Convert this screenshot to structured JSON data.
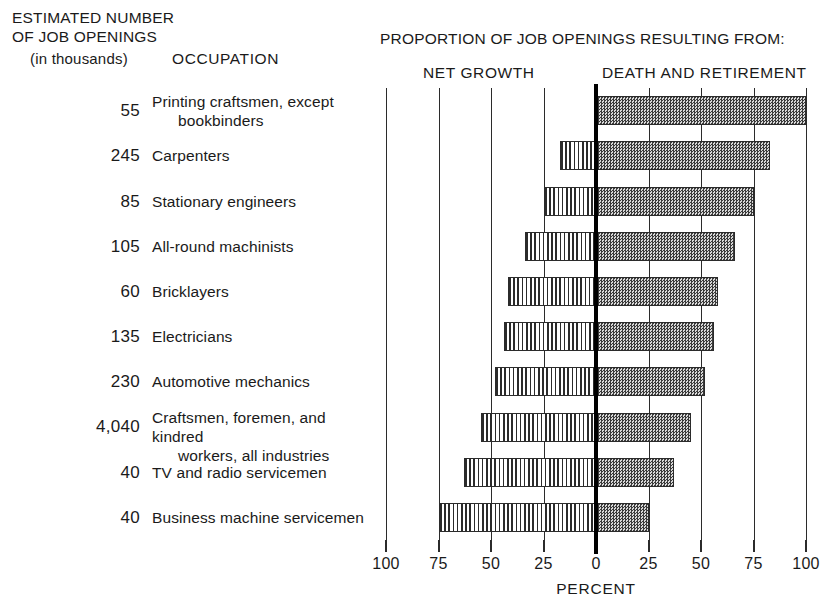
{
  "headers": {
    "left_line1": "ESTIMATED NUMBER",
    "left_line2": "OF JOB OPENINGS",
    "left_line3": "(in thousands)",
    "occupation": "OCCUPATION",
    "proportion_title": "PROPORTION OF JOB OPENINGS RESULTING FROM:",
    "net_growth": "NET GROWTH",
    "death_and_retirement": "DEATH AND RETIREMENT"
  },
  "axis": {
    "title": "PERCENT",
    "tick_labels": [
      "100",
      "75",
      "50",
      "25",
      "0",
      "25",
      "50",
      "75",
      "100"
    ],
    "tick_values": [
      -100,
      -75,
      -50,
      -25,
      0,
      25,
      50,
      75,
      100
    ]
  },
  "colors": {
    "ink": "#2b2b2b",
    "zero_line": "#000000",
    "death_fill": "#8d8d8d",
    "growth_fill": "#ffffff"
  },
  "chart_data": {
    "type": "bar",
    "title": "PROPORTION OF JOB OPENINGS RESULTING FROM:",
    "xlabel": "PERCENT",
    "ylabel": "OCCUPATION",
    "xlim": [
      -100,
      100
    ],
    "grid": true,
    "legend_position": "top",
    "orientation": "horizontal-diverging",
    "categories": [
      "Printing craftsmen, except bookbinders",
      "Carpenters",
      "Stationary engineers",
      "All-round machinists",
      "Bricklayers",
      "Electricians",
      "Automotive mechanics",
      "Craftsmen, foremen, and kindred workers, all industries",
      "TV and radio servicemen",
      "Business machine servicemen"
    ],
    "series": [
      {
        "name": "NET GROWTH",
        "values": [
          0,
          17,
          25,
          34,
          42,
          44,
          48,
          55,
          63,
          75
        ]
      },
      {
        "name": "DEATH AND RETIREMENT",
        "values": [
          100,
          83,
          75,
          66,
          58,
          56,
          52,
          45,
          37,
          25
        ]
      }
    ],
    "estimated_job_openings_thousands": [
      "55",
      "245",
      "85",
      "105",
      "60",
      "135",
      "230",
      "4,040",
      "40",
      "40"
    ]
  },
  "rows": [
    {
      "num": "55",
      "occ_line1": "Printing craftsmen, except",
      "occ_line2": "bookbinders",
      "growth": 0,
      "death": 100
    },
    {
      "num": "245",
      "occ_line1": "Carpenters",
      "occ_line2": "",
      "growth": 17,
      "death": 83
    },
    {
      "num": "85",
      "occ_line1": "Stationary engineers",
      "occ_line2": "",
      "growth": 25,
      "death": 75
    },
    {
      "num": "105",
      "occ_line1": "All-round machinists",
      "occ_line2": "",
      "growth": 34,
      "death": 66
    },
    {
      "num": "60",
      "occ_line1": "Bricklayers",
      "occ_line2": "",
      "growth": 42,
      "death": 58
    },
    {
      "num": "135",
      "occ_line1": "Electricians",
      "occ_line2": "",
      "growth": 44,
      "death": 56
    },
    {
      "num": "230",
      "occ_line1": "Automotive mechanics",
      "occ_line2": "",
      "growth": 48,
      "death": 52
    },
    {
      "num": "4,040",
      "occ_line1": "Craftsmen, foremen, and kindred",
      "occ_line2": "workers, all industries",
      "growth": 55,
      "death": 45
    },
    {
      "num": "40",
      "occ_line1": "TV and radio servicemen",
      "occ_line2": "",
      "growth": 63,
      "death": 37
    },
    {
      "num": "40",
      "occ_line1": "Business machine servicemen",
      "occ_line2": "",
      "growth": 75,
      "death": 25
    }
  ]
}
